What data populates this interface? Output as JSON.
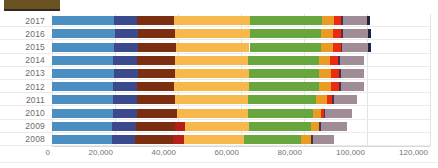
{
  "title_swatch": {
    "name": "legend-swatch",
    "color": "#6b5321"
  },
  "axis": {
    "x_ticks": [
      "0",
      "20,000",
      "40,000",
      "60,000",
      "80,000",
      "100,000",
      "120,000"
    ],
    "y_ticks": [
      "2017",
      "2016",
      "2015",
      "2014",
      "2013",
      "2012",
      "2011",
      "2010",
      "2009",
      "2008"
    ]
  },
  "chart_data": {
    "type": "bar",
    "orientation": "horizontal",
    "stacked": true,
    "title": "",
    "xlabel": "",
    "ylabel": "",
    "xlim": [
      0,
      120000
    ],
    "grid": true,
    "legend": "none",
    "categories": [
      "2017",
      "2016",
      "2015",
      "2014",
      "2013",
      "2012",
      "2011",
      "2010",
      "2009",
      "2008"
    ],
    "series": [
      {
        "name": "Series 1",
        "color": "#4a8ec2",
        "values": [
          19800,
          19900,
          19600,
          19500,
          19600,
          19500,
          19400,
          19300,
          19100,
          19000
        ]
      },
      {
        "name": "Series 2",
        "color": "#3b4a8c",
        "values": [
          7300,
          7300,
          7600,
          7600,
          7700,
          7400,
          7500,
          7700,
          7700,
          7400
        ]
      },
      {
        "name": "Series 3",
        "color": "#7b2f10",
        "values": [
          11700,
          11700,
          12100,
          11800,
          11800,
          11800,
          12100,
          12700,
          12300,
          12100
        ]
      },
      {
        "name": "Series 4",
        "color": "#b41f16",
        "values": [
          0,
          0,
          0,
          0,
          0,
          0,
          0,
          0,
          3000,
          3400
        ]
      },
      {
        "name": "Series 5",
        "color": "#f7b84b",
        "values": [
          24200,
          24100,
          23400,
          23300,
          23300,
          23900,
          23200,
          22500,
          20300,
          19000
        ]
      },
      {
        "name": "Series 6",
        "color": "#66a63c",
        "values": [
          22700,
          22400,
          22600,
          22500,
          22400,
          22300,
          21500,
          20800,
          19800,
          18200
        ]
      },
      {
        "name": "Series 7",
        "color": "#e99b22",
        "values": [
          3700,
          3800,
          3800,
          3600,
          3800,
          3800,
          3500,
          2400,
          2600,
          3100
        ]
      },
      {
        "name": "Series 8",
        "color": "#ec2a10",
        "values": [
          2500,
          2600,
          2500,
          2600,
          2600,
          2500,
          1800,
          800,
          0,
          0
        ]
      },
      {
        "name": "Series 9",
        "color": "#4b2f4e",
        "values": [
          600,
          600,
          600,
          600,
          600,
          600,
          600,
          600,
          600,
          600
        ]
      },
      {
        "name": "Series 10",
        "color": "#a08c96",
        "values": [
          7600,
          8000,
          8200,
          7600,
          7300,
          7200,
          7300,
          8600,
          8300,
          6800
        ]
      },
      {
        "name": "Series 11",
        "color": "#1b2340",
        "values": [
          700,
          800,
          900,
          0,
          0,
          0,
          0,
          0,
          0,
          0
        ]
      }
    ]
  }
}
